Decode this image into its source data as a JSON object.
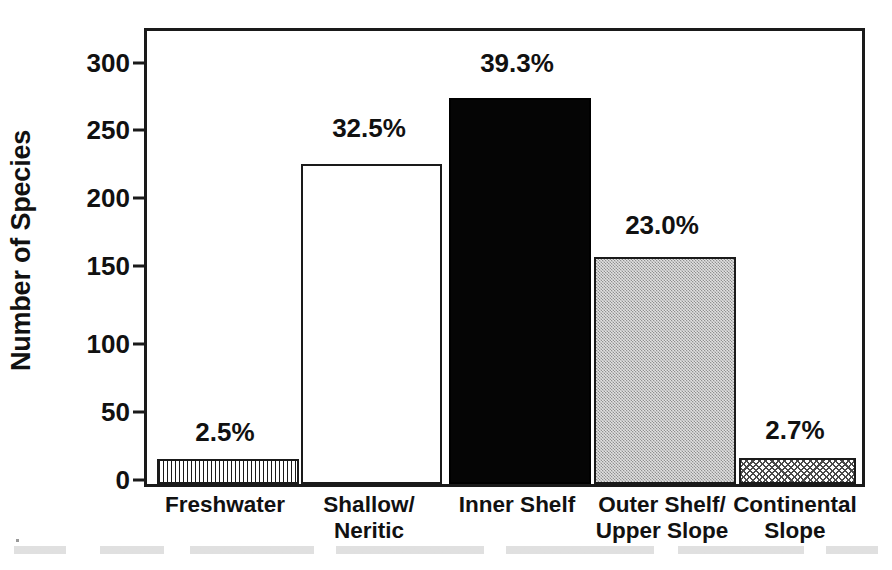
{
  "chart_data": {
    "type": "bar",
    "title": "",
    "xlabel": "",
    "ylabel": "Number of Species",
    "ylim": [
      0,
      330
    ],
    "yticks": [
      0,
      50,
      100,
      150,
      200,
      250,
      300
    ],
    "ytick_labels": [
      "0",
      "50",
      "100",
      "150",
      "200",
      "250",
      "300"
    ],
    "grid": false,
    "legend": "none",
    "categories": [
      "Freshwater",
      "Shallow/\nNeritic",
      "Inner Shelf",
      "Outer Shelf/\nUpper Slope",
      "Continental\nSlope"
    ],
    "values": [
      18,
      233,
      281,
      165,
      19
    ],
    "data_labels": [
      "2.5%",
      "32.5%",
      "39.3%",
      "23.0%",
      "2.7%"
    ],
    "percentages": [
      2.5,
      32.5,
      39.3,
      23.0,
      2.7
    ],
    "bar_fills": [
      "vertical-lines",
      "open-white",
      "solid-black",
      "light-gray-stipple",
      "crosshatch"
    ]
  },
  "axes": {
    "y_title": "Number of Species",
    "y_ticks": [
      {
        "label": "300",
        "value": 300
      },
      {
        "label": "250",
        "value": 250
      },
      {
        "label": "200",
        "value": 200
      },
      {
        "label": "150",
        "value": 150
      },
      {
        "label": "100",
        "value": 100
      },
      {
        "label": "50",
        "value": 50
      },
      {
        "label": "0",
        "value": 0
      }
    ]
  },
  "bars": [
    {
      "id": "freshwater",
      "label_line1": "Freshwater",
      "label_line2": "",
      "value": 18,
      "data_label": "2.5%",
      "fill": "vertical-lines"
    },
    {
      "id": "shallow-neritic",
      "label_line1": "Shallow/",
      "label_line2": "Neritic",
      "value": 233,
      "data_label": "32.5%",
      "fill": "open-white"
    },
    {
      "id": "inner-shelf",
      "label_line1": "Inner Shelf",
      "label_line2": "",
      "value": 281,
      "data_label": "39.3%",
      "fill": "solid-black"
    },
    {
      "id": "outer-shelf-upper-slope",
      "label_line1": "Outer Shelf/",
      "label_line2": "Upper Slope",
      "value": 165,
      "data_label": "23.0%",
      "fill": "light-gray-stipple"
    },
    {
      "id": "continental-slope",
      "label_line1": "Continental",
      "label_line2": "Slope",
      "value": 19,
      "data_label": "2.7%",
      "fill": "crosshatch"
    }
  ],
  "colors": {
    "axis": "#1a1a1a",
    "text": "#111111",
    "background": "#ffffff",
    "solid_bar": "#050505",
    "gray_bar": "#bdbdbd"
  }
}
